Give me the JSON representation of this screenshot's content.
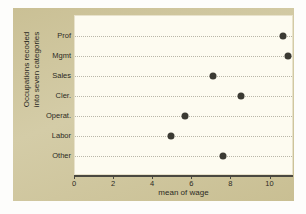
{
  "chart_data": {
    "type": "scatter",
    "title": "",
    "xlabel": "mean of wage",
    "ylabel": "Occupations recoded into seven categories",
    "ylabel_line1": "Occupations recoded",
    "ylabel_line2": "into seven categories",
    "categories": [
      "Prof",
      "Mgmt",
      "Sales",
      "Cler.",
      "Operat.",
      "Labor",
      "Other"
    ],
    "values": [
      10.65,
      10.9,
      7.05,
      8.5,
      5.65,
      4.9,
      7.55
    ],
    "xlim": [
      0,
      11.2
    ],
    "xticks": [
      0,
      2,
      4,
      6,
      8,
      10
    ],
    "xtick_labels": [
      "0",
      "2",
      "4",
      "6",
      "8",
      "10"
    ],
    "grid": "horizontal-dotted",
    "legend": "none",
    "point_color": "#3b3a33",
    "panel_color": "#fdfbf0",
    "figure_color": "#cfc69f"
  }
}
